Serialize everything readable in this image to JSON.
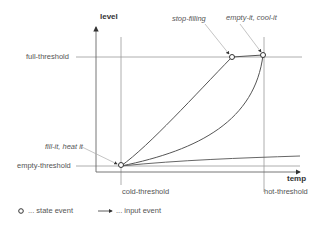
{
  "axes": {
    "y_label": "level",
    "x_label": "temp"
  },
  "thresholds": {
    "full": "full-threshold",
    "empty": "empty-threshold",
    "cold": "cold-threshold",
    "hot": "hot-threshold"
  },
  "events": {
    "fill": "fill-it, heat it",
    "stop": "stop-filling",
    "empty": "empty-it, cool-it"
  },
  "legend": {
    "state_event": "... state event",
    "input_event": "... input event"
  },
  "colors": {
    "line": "#888888",
    "curve": "#555555",
    "axis": "#333333"
  }
}
